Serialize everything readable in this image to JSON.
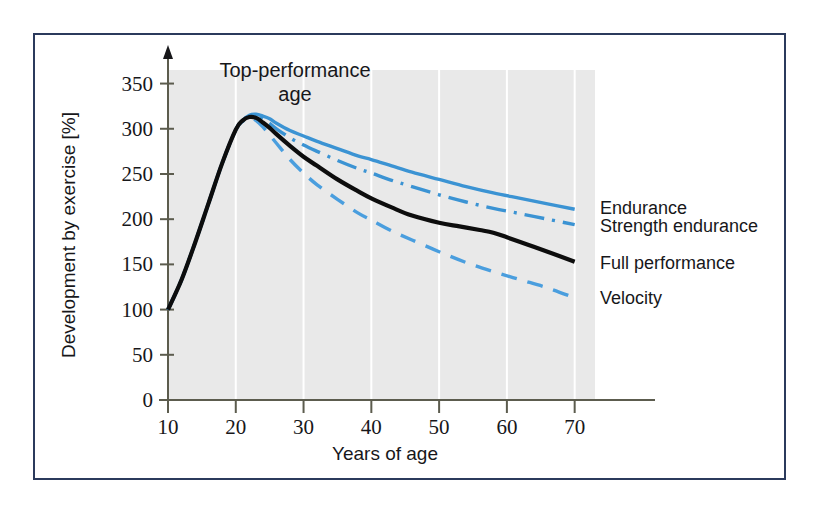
{
  "figure": {
    "frame_color": "#2b3a5c",
    "plot_background": "#e9e9e9",
    "gridline_color": "#ffffff",
    "axis_color": "#5c5c4e"
  },
  "annotation": {
    "line1": "Top-performance",
    "line2": "age"
  },
  "chart_data": {
    "type": "line",
    "title": "",
    "xlabel": "Years of age",
    "ylabel": "Development by exercise [%]",
    "xlim": [
      10,
      73
    ],
    "ylim": [
      0,
      365
    ],
    "xticks": [
      10,
      20,
      30,
      40,
      50,
      60,
      70
    ],
    "xtick_labels": [
      "10",
      "20",
      "30",
      "40",
      "50",
      "60",
      "70"
    ],
    "yticks": [
      0,
      50,
      100,
      150,
      200,
      250,
      300,
      350
    ],
    "ytick_labels": [
      "0",
      "50",
      "100",
      "150",
      "200",
      "250",
      "300",
      "350"
    ],
    "grid": "vertical-only",
    "legend_position": "right-inline-at-line-ends",
    "annotations": [
      {
        "text": "Top-performance age",
        "x": 22,
        "y": 350
      }
    ],
    "series": [
      {
        "name": "Endurance",
        "color": "#3b93d3",
        "style": "solid",
        "width": 3.4,
        "label_x": 73,
        "label_y": 212,
        "x": [
          10,
          12,
          14,
          16,
          18,
          20,
          21,
          22,
          23,
          24,
          25,
          26,
          28,
          30,
          32,
          35,
          38,
          40,
          43,
          46,
          50,
          54,
          58,
          62,
          66,
          70
        ],
        "y": [
          100,
          133,
          174,
          218,
          262,
          299,
          309,
          315,
          316,
          314,
          311,
          306,
          298,
          292,
          286,
          278,
          270,
          266,
          259,
          252,
          244,
          236,
          229,
          223,
          217,
          211
        ]
      },
      {
        "name": "Strength endurance",
        "color": "#3b93d3",
        "style": "dash-dot",
        "width": 3.4,
        "label_x": 73,
        "label_y": 192,
        "x": [
          10,
          12,
          14,
          16,
          18,
          20,
          21,
          22,
          23,
          24,
          25,
          26,
          28,
          30,
          32,
          35,
          38,
          40,
          43,
          46,
          50,
          54,
          58,
          62,
          66,
          70
        ],
        "y": [
          100,
          133,
          174,
          218,
          262,
          299,
          309,
          314,
          314,
          311,
          306,
          300,
          290,
          282,
          275,
          265,
          256,
          251,
          243,
          236,
          227,
          219,
          212,
          206,
          200,
          194
        ]
      },
      {
        "name": "Full performance",
        "color": "#0d0d0d",
        "style": "solid",
        "width": 4.2,
        "label_x": 73,
        "label_y": 152,
        "x": [
          10,
          12,
          14,
          16,
          18,
          20,
          21,
          22,
          23,
          24,
          25,
          26,
          28,
          30,
          32,
          35,
          38,
          40,
          43,
          46,
          50,
          53,
          56,
          58,
          60,
          63,
          66,
          70
        ],
        "y": [
          100,
          133,
          174,
          218,
          262,
          299,
          309,
          313,
          312,
          307,
          301,
          294,
          281,
          269,
          259,
          244,
          231,
          223,
          213,
          204,
          196,
          192,
          188,
          185,
          180,
          172,
          164,
          153
        ]
      },
      {
        "name": "Velocity",
        "color": "#4a9ede",
        "style": "dashed",
        "width": 3.4,
        "label_x": 73,
        "label_y": 113,
        "x": [
          10,
          12,
          14,
          16,
          18,
          20,
          21,
          22,
          23,
          24,
          25,
          26,
          28,
          30,
          32,
          35,
          38,
          40,
          43,
          46,
          50,
          54,
          58,
          62,
          66,
          70
        ],
        "y": [
          100,
          133,
          174,
          218,
          262,
          299,
          308,
          312,
          309,
          302,
          293,
          284,
          266,
          251,
          238,
          222,
          207,
          199,
          187,
          177,
          164,
          152,
          142,
          133,
          124,
          113
        ]
      }
    ]
  }
}
